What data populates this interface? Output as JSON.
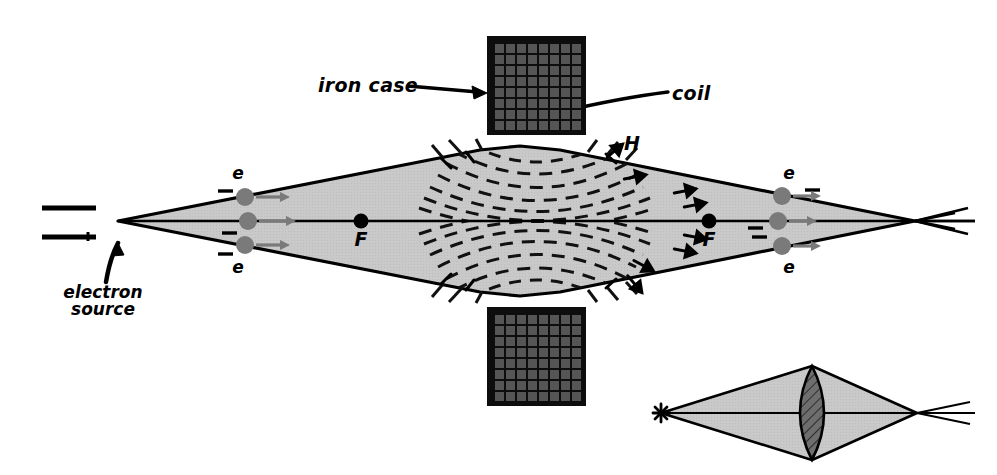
{
  "figure": {
    "background_color": "#ffffff",
    "ink_color": "#000000",
    "beam_fill": "#c9c9c9",
    "coil_cell_color": "#555555",
    "electron_color": "#7a7a7a",
    "lens_fill": "#6b6b6b"
  },
  "labels": {
    "iron_case": "iron case",
    "coil": "coil",
    "field_H": "H",
    "electron_source": "electron\nsource",
    "electron_source_line1": "electron",
    "electron_source_line2": "source",
    "electron_marker": "e",
    "focus_marker": "F"
  },
  "annotations": [
    {
      "name": "iron-case-label",
      "text": "iron case",
      "x": 318,
      "y": 74,
      "leader": "arrow-right-to-top-magnet"
    },
    {
      "name": "coil-label",
      "text": "coil",
      "x": 672,
      "y": 82,
      "leader": "curved-arrow-left-into-coil-grid"
    },
    {
      "name": "field-H-label",
      "text": "H",
      "x": 624,
      "y": 132,
      "leader": "short-diagonal-arrow"
    },
    {
      "name": "electron-source-label",
      "text": "electron source",
      "x": 48,
      "y": 284,
      "leader": "curved-arrow-up-right"
    }
  ],
  "components": {
    "electron_source_plates": [
      {
        "name": "upper-plate",
        "x1": 42,
        "y1": 208,
        "x2": 96,
        "y2": 208
      },
      {
        "name": "lower-plate",
        "x1": 42,
        "y1": 237,
        "x2": 96,
        "y2": 237
      }
    ],
    "optical_axis": {
      "y": 221,
      "x1": 118,
      "x2": 975
    },
    "beam_vertex_left": {
      "x": 118,
      "y": 221
    },
    "beam_vertex_right": {
      "x": 915,
      "y": 221
    },
    "focal_points": [
      {
        "name": "focus-left",
        "label": "F",
        "x": 361,
        "y": 221
      },
      {
        "name": "focus-right",
        "label": "F",
        "x": 709,
        "y": 221
      }
    ],
    "electrons": [
      {
        "name": "electron-upper-left",
        "label": "e",
        "x": 245,
        "y": 197,
        "charge_sign": "−",
        "direction": "right"
      },
      {
        "name": "electron-axis-left",
        "label": "",
        "x": 248,
        "y": 221,
        "charge_sign": "−",
        "direction": "right"
      },
      {
        "name": "electron-lower-left",
        "label": "e",
        "x": 245,
        "y": 245,
        "charge_sign": "−",
        "direction": "right"
      },
      {
        "name": "electron-upper-right",
        "label": "e",
        "x": 782,
        "y": 196,
        "charge_sign": "−",
        "direction": "right"
      },
      {
        "name": "electron-axis-right",
        "label": "",
        "x": 778,
        "y": 221,
        "charge_sign": "−",
        "direction": "right"
      },
      {
        "name": "electron-lower-right",
        "label": "e",
        "x": 782,
        "y": 246,
        "charge_sign": "−",
        "direction": "right"
      }
    ],
    "magnet_top": {
      "name": "iron-case-top",
      "x": 487,
      "y": 36,
      "width": 99,
      "height": 99,
      "grid_rows": 8,
      "grid_cols": 8,
      "pole_gap": "semicircle-bottom-center"
    },
    "magnet_bottom": {
      "name": "iron-case-bottom",
      "x": 487,
      "y": 307,
      "width": 99,
      "height": 99,
      "grid_rows": 8,
      "grid_cols": 8,
      "pole_gap": "semicircle-top-center"
    },
    "field_lines": {
      "style": "dashed",
      "description": "concentric arcs spanning the pole gap above and below the optical axis",
      "count": 12
    }
  },
  "inset": {
    "name": "optical-analogy-inset",
    "description": "Point light source, converging cone through a biconvex glass lens to a focus",
    "source_point": {
      "x": 661,
      "y": 413,
      "glyph": "star"
    },
    "lens": {
      "x": 812,
      "y": 413,
      "half_width": 23,
      "half_height": 47,
      "hatched": true
    },
    "focus_point": {
      "x": 917,
      "y": 413
    },
    "axis": {
      "y": 413,
      "x1": 661,
      "x2": 975
    }
  }
}
